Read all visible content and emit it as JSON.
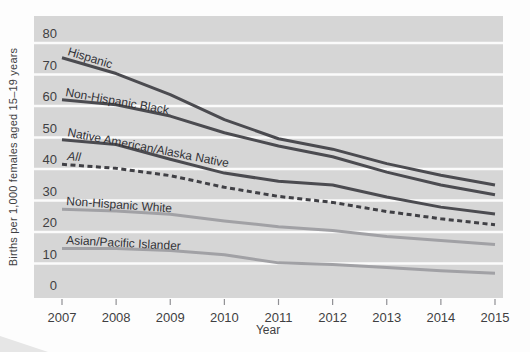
{
  "chart_data": {
    "type": "line",
    "title": "",
    "xlabel": "Year",
    "ylabel": "Births per 1,000 females aged 15–19 years",
    "x": [
      2007,
      2008,
      2009,
      2010,
      2011,
      2012,
      2013,
      2014,
      2015
    ],
    "y_ticks": [
      0,
      10,
      20,
      30,
      40,
      50,
      60,
      70,
      80
    ],
    "ylim": [
      0,
      88
    ],
    "grid": "horizontal white gridlines on gray plot background",
    "legend": "inline rotated labels above each line",
    "series": [
      {
        "name": "Hispanic",
        "values": [
          75.3,
          70.3,
          63.6,
          55.7,
          49.6,
          46.3,
          41.7,
          38.0,
          34.9
        ],
        "color": "#4b4b50",
        "dash": false,
        "label": {
          "x": 67,
          "y": 55,
          "rot": 17,
          "italic": false
        }
      },
      {
        "name": "Non-Hispanic Black",
        "values": [
          62.0,
          60.4,
          56.8,
          51.5,
          47.3,
          43.9,
          39.0,
          34.9,
          31.8
        ],
        "color": "#4b4b50",
        "dash": false,
        "label": {
          "x": 65,
          "y": 96,
          "rot": 10,
          "italic": false
        }
      },
      {
        "name": "Native American/Alaska Native",
        "values": [
          49.3,
          47.8,
          43.1,
          38.7,
          36.1,
          34.9,
          31.1,
          27.9,
          25.7
        ],
        "color": "#4b4b50",
        "dash": false,
        "label": {
          "x": 67,
          "y": 136,
          "rot": 11,
          "italic": false
        }
      },
      {
        "name": "All",
        "values": [
          41.5,
          40.2,
          37.9,
          34.2,
          31.3,
          29.4,
          26.5,
          24.2,
          22.3
        ],
        "color": "#404045",
        "dash": true,
        "label": {
          "x": 67,
          "y": 160,
          "rot": 5,
          "italic": true
        }
      },
      {
        "name": "Non-Hispanic White",
        "values": [
          27.2,
          26.7,
          25.6,
          23.5,
          21.7,
          20.5,
          18.6,
          17.3,
          16.0
        ],
        "color": "#a1a1a5",
        "dash": false,
        "label": {
          "x": 66,
          "y": 205,
          "rot": 4,
          "italic": false
        }
      },
      {
        "name": "Asian/Pacific Islander",
        "values": [
          14.8,
          14.8,
          14.1,
          12.8,
          10.2,
          9.7,
          8.7,
          7.7,
          6.9
        ],
        "color": "#a1a1a5",
        "dash": false,
        "label": {
          "x": 66,
          "y": 244,
          "rot": 3,
          "italic": false
        }
      }
    ],
    "colors": {
      "plot_bg": "#d6d6d6",
      "gridline": "#fbfbfb",
      "text": "#3f3f42",
      "label_text": "#323236",
      "tick": "#909094"
    }
  }
}
